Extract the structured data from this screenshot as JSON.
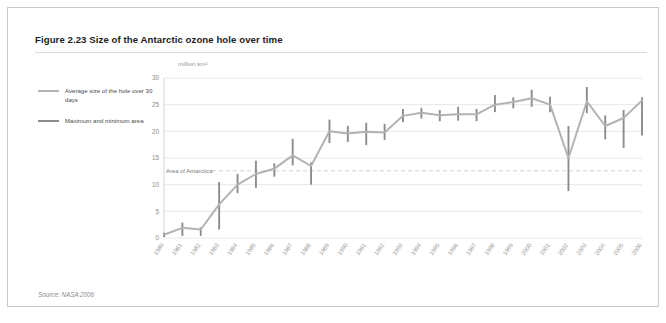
{
  "figure": {
    "title": "Figure 2.23 Size of the Antarctic ozone hole over time",
    "source": "Source: NASA 2006"
  },
  "legend": {
    "items": [
      {
        "label": "Average size of the hole over 30 days",
        "color": "#b3b3b3"
      },
      {
        "label": "Maximum and minimum area",
        "color": "#8c8c8c"
      }
    ]
  },
  "chart_data": {
    "type": "line",
    "title": "Figure 2.23 Size of the Antarctic ozone hole over time",
    "subtitle": "",
    "xlabel": "",
    "ylabel": "million km²",
    "yunit": "million km²",
    "ylim": [
      0,
      30
    ],
    "yticks": [
      0,
      5,
      10,
      15,
      20,
      25,
      30
    ],
    "ytick_labels": [
      "0",
      "5",
      "10",
      "15",
      "20",
      "25",
      "30"
    ],
    "grid": true,
    "legend_position": "left",
    "categories": [
      "1980",
      "1981",
      "1982",
      "1983",
      "1984",
      "1985",
      "1986",
      "1987",
      "1988",
      "1989",
      "1990",
      "1991",
      "1992",
      "1993",
      "1994",
      "1995",
      "1996",
      "1997",
      "1998",
      "1999",
      "2000",
      "2001",
      "2002",
      "2003",
      "2004",
      "2005",
      "2006"
    ],
    "series": [
      {
        "name": "Average size of the hole over 30 days",
        "color": "#b3b3b3",
        "values": [
          0.6,
          1.9,
          1.6,
          6.3,
          10.0,
          12.0,
          13.0,
          15.5,
          13.5,
          20.0,
          19.6,
          19.9,
          19.8,
          22.9,
          23.5,
          23.0,
          23.2,
          23.2,
          25.0,
          25.5,
          26.2,
          25.0,
          15.0,
          25.6,
          21.0,
          22.5,
          25.8
        ]
      },
      {
        "name": "Maximum and minimum area",
        "color": "#8c8c8c",
        "max_values": [
          1.0,
          2.9,
          2.0,
          10.5,
          12.0,
          14.5,
          14.0,
          18.6,
          14.2,
          22.2,
          21.0,
          21.6,
          21.4,
          24.2,
          24.4,
          24.0,
          24.6,
          24.2,
          26.8,
          26.4,
          27.8,
          26.5,
          21.0,
          28.3,
          23.0,
          24.0,
          26.4
        ],
        "min_values": [
          0.2,
          0.4,
          0.4,
          1.6,
          8.4,
          9.4,
          11.5,
          13.6,
          10.0,
          17.8,
          18.0,
          17.4,
          18.4,
          21.7,
          22.4,
          21.9,
          22.0,
          21.9,
          23.6,
          24.3,
          24.6,
          23.6,
          8.8,
          23.4,
          18.5,
          16.9,
          19.2
        ]
      }
    ],
    "annotations": [
      {
        "label": "Area of Antarctica",
        "y": 12.6,
        "style": "dashed"
      }
    ]
  }
}
